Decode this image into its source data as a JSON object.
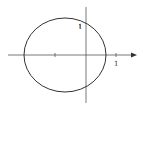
{
  "diagram": {
    "type": "ellipse-on-axes",
    "axes": {
      "x_arrow": true,
      "x_tick_label": "1",
      "y_tick_label": "1"
    },
    "ellipse": {
      "cx": 65,
      "cy": 55,
      "rx": 41,
      "ry": 37
    },
    "colors": {
      "stroke": "#333333",
      "axis": "#555555",
      "background": "#ffffff"
    }
  }
}
